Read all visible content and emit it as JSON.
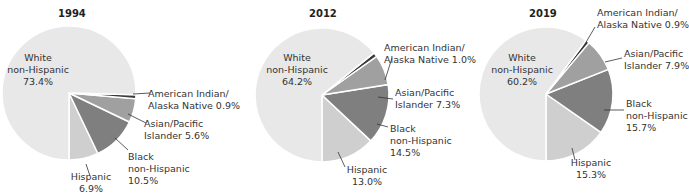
{
  "chart_data": [
    {
      "type": "pie",
      "title": "1994",
      "slices": [
        {
          "label": "White non-Hispanic",
          "value": 73.4,
          "color": "#e8e8e8"
        },
        {
          "label": "American Indian/Alaska Native",
          "value": 0.9,
          "color": "#3a3a3a"
        },
        {
          "label": "Asian/Pacific Islander",
          "value": 5.6,
          "color": "#a0a0a0"
        },
        {
          "label": "Black non-Hispanic",
          "value": 10.5,
          "color": "#7f7f7f"
        },
        {
          "label": "Hispanic",
          "value": 6.9,
          "color": "#cfcfcf"
        }
      ]
    },
    {
      "type": "pie",
      "title": "2012",
      "slices": [
        {
          "label": "White non-Hispanic",
          "value": 64.2,
          "color": "#e8e8e8"
        },
        {
          "label": "American Indian/Alaska Native",
          "value": 1.0,
          "color": "#3a3a3a"
        },
        {
          "label": "Asian/Pacific Islander",
          "value": 7.3,
          "color": "#a0a0a0"
        },
        {
          "label": "Black non-Hispanic",
          "value": 14.5,
          "color": "#7f7f7f"
        },
        {
          "label": "Hispanic",
          "value": 13.0,
          "color": "#cfcfcf"
        }
      ]
    },
    {
      "type": "pie",
      "title": "2019",
      "slices": [
        {
          "label": "White non-Hispanic",
          "value": 60.2,
          "color": "#e8e8e8"
        },
        {
          "label": "American Indian/Alaska Native",
          "value": 0.9,
          "color": "#3a3a3a"
        },
        {
          "label": "Asian/Pacific Islander",
          "value": 7.9,
          "color": "#a0a0a0"
        },
        {
          "label": "Black non-Hispanic",
          "value": 15.7,
          "color": "#7f7f7f"
        },
        {
          "label": "Hispanic",
          "value": 15.3,
          "color": "#cfcfcf"
        }
      ]
    }
  ],
  "charts": [
    {
      "title": "1994",
      "white": {
        "line1": "White",
        "line2": "non-Hispanic",
        "pct": "73.4%"
      },
      "amind": {
        "line1": "American Indian/",
        "line2": "Alaska Native 0.9%"
      },
      "asian": {
        "line1": "Asian/Pacific",
        "line2": "Islander 5.6%"
      },
      "black": {
        "line1": "Black",
        "line2": "non-Hispanic",
        "pct": "10.5%"
      },
      "hisp": {
        "line1": "Hispanic",
        "pct": "6.9%"
      }
    },
    {
      "title": "2012",
      "white": {
        "line1": "White",
        "line2": "non-Hispanic",
        "pct": "64.2%"
      },
      "amind": {
        "line1": "American Indian/",
        "line2": "Alaska Native 1.0%"
      },
      "asian": {
        "line1": "Asian/Pacific",
        "line2": "Islander 7.3%"
      },
      "black": {
        "line1": "Black",
        "line2": "non-Hispanic",
        "pct": "14.5%"
      },
      "hisp": {
        "line1": "Hispanic",
        "pct": "13.0%"
      }
    },
    {
      "title": "2019",
      "white": {
        "line1": "White",
        "line2": "non-Hispanic",
        "pct": "60.2%"
      },
      "amind": {
        "line1": "American Indian/",
        "line2": "Alaska Native 0.9%"
      },
      "asian": {
        "line1": "Asian/Pacific",
        "line2": "Islander 7.9%"
      },
      "black": {
        "line1": "Black",
        "line2": "non-Hispanic",
        "pct": "15.7%"
      },
      "hisp": {
        "line1": "Hispanic",
        "pct": "15.3%"
      }
    }
  ]
}
